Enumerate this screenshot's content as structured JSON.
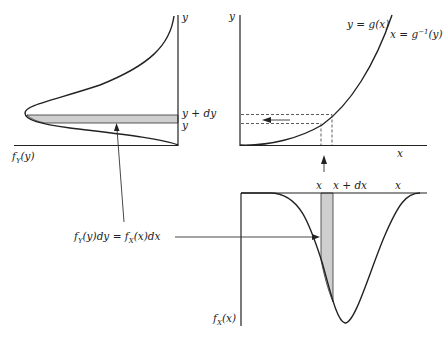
{
  "figure": {
    "colors": {
      "ink": "#222222",
      "band_fill": "#cfcfcf",
      "background": "#ffffff"
    }
  },
  "top_left_panel": {
    "y_axis_label": "y",
    "band_upper_label": "y + dy",
    "band_lower_label": "y",
    "density_label_main": "f",
    "density_label_sub": "Y",
    "density_label_arg": "(y)"
  },
  "top_right_panel": {
    "y_axis_label": "y",
    "x_axis_label": "x",
    "curve_label": "y = g(x)",
    "inverse_label_main": "x = g",
    "inverse_label_sup": "−1",
    "inverse_label_arg": "(y)"
  },
  "bottom_panel": {
    "band_left_label": "x",
    "band_right_label": "x + dx",
    "x_axis_label": "x",
    "density_label_main": "f",
    "density_label_sub": "X",
    "density_label_arg": "(x)"
  },
  "equation": {
    "lhs_main": "f",
    "lhs_sub": "Y",
    "lhs_rest": "(y)dy = ",
    "rhs_main": "f",
    "rhs_sub": "X",
    "rhs_rest": "(x)dx"
  }
}
